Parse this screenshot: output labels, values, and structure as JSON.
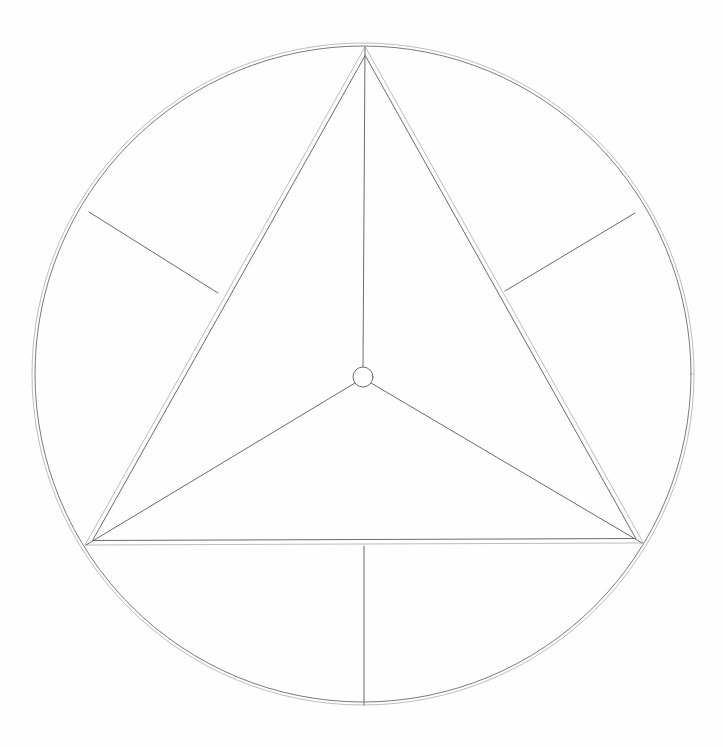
{
  "document": {
    "title": "Inscribed Equilateral Triangle Construction",
    "kind": "geometric-line-drawing",
    "canvas_width": 723,
    "canvas_height": 747,
    "background_color": "#fefefe"
  },
  "style": {
    "primary_stroke_color": "#6b6b70",
    "light_stroke_color": "#b4b4ba",
    "hub_fill_color": "#ffffff",
    "thin_width": 1,
    "hair_width": 0.9
  },
  "geometry": {
    "outer_circle": {
      "label": "outer-circle",
      "center_x": 363,
      "center_y": 374,
      "radius_outer": 331,
      "radius_inner": 328,
      "double_line": true
    },
    "triangle": {
      "label": "inscribed-triangle",
      "double_line": true,
      "offset": 4,
      "vertices": [
        {
          "name": "apex",
          "x": 365,
          "y": 47
        },
        {
          "name": "bottom-left",
          "x": 85,
          "y": 545
        },
        {
          "name": "bottom-right",
          "x": 643,
          "y": 543
        }
      ]
    },
    "hub": {
      "label": "center-hub",
      "center_x": 363,
      "center_y": 377,
      "radius": 10
    },
    "spokes": [
      {
        "name": "spoke-to-apex",
        "x1": 363,
        "y1": 367,
        "x2": 365,
        "y2": 47
      },
      {
        "name": "spoke-to-bottom-left",
        "x1": 355,
        "y1": 383,
        "x2": 86,
        "y2": 545
      },
      {
        "name": "spoke-to-bottom-right",
        "x1": 371,
        "y1": 383,
        "x2": 642,
        "y2": 543
      }
    ],
    "radial_stubs": [
      {
        "name": "stub-upper-left",
        "x1": 218,
        "y1": 293,
        "x2": 89,
        "y2": 212
      },
      {
        "name": "stub-upper-right",
        "x1": 505,
        "y1": 291,
        "x2": 635,
        "y2": 213
      },
      {
        "name": "stub-bottom",
        "x1": 364,
        "y1": 546,
        "x2": 364,
        "y2": 705
      }
    ]
  },
  "chart_data": {
    "type": "scatter",
    "xlabel": "",
    "ylabel": "",
    "xlim": [
      0,
      723
    ],
    "ylim": [
      747,
      0
    ],
    "grid": false,
    "legend": "none",
    "annotations": [
      "Outer circle centered at (363, 374) with radius 331",
      "Equilateral triangle inscribed with vertices at (365,47), (85,545), (643,543)",
      "Central hub circle radius 10 at (363, 377)",
      "Three spokes connect hub to each triangle vertex",
      "Three radial stubs run from each triangle edge midpoint outward to the circle"
    ],
    "series": [
      {
        "name": "triangle-vertices",
        "x": [
          365,
          85,
          643
        ],
        "y": [
          47,
          545,
          543
        ]
      },
      {
        "name": "edge-midpoints",
        "x": [
          218,
          505,
          364
        ],
        "y": [
          293,
          291,
          546
        ]
      },
      {
        "name": "circle-stub-endpoints",
        "x": [
          89,
          635,
          364
        ],
        "y": [
          212,
          213,
          705
        ]
      },
      {
        "name": "center",
        "x": [
          363
        ],
        "y": [
          377
        ]
      }
    ]
  }
}
